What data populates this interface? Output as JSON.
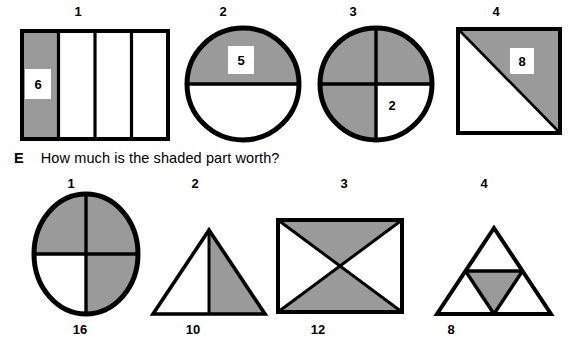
{
  "worksheet": {
    "question": {
      "tag": "E",
      "text": "How much is the shaded part worth?"
    },
    "colors": {
      "shade": "#9a9a9a",
      "stroke": "#000000",
      "background": "#ffffff"
    },
    "top_row": {
      "items": [
        {
          "number": "1",
          "shape": "rectangle-four-vertical-strips",
          "shaded_parts": 1,
          "total_parts": 4,
          "value_label": "6"
        },
        {
          "number": "2",
          "shape": "circle-halves",
          "shaded_parts": 1,
          "total_parts": 2,
          "value_label": "5"
        },
        {
          "number": "3",
          "shape": "circle-quarters",
          "shaded_parts": 3,
          "total_parts": 4,
          "value_label": "2"
        },
        {
          "number": "4",
          "shape": "square-diagonal-halves",
          "shaded_parts": 1,
          "total_parts": 2,
          "value_label": "8"
        }
      ]
    },
    "bottom_row": {
      "items": [
        {
          "number": "1",
          "shape": "circle-quarters",
          "shaded_parts": 3,
          "total_parts": 4,
          "value_label": "16"
        },
        {
          "number": "2",
          "shape": "triangle-vertical-halves",
          "shaded_parts": 1,
          "total_parts": 2,
          "value_label": "10"
        },
        {
          "number": "3",
          "shape": "rectangle-both-diagonals-bowtie",
          "shaded_parts": 2,
          "total_parts": 4,
          "value_label": "12"
        },
        {
          "number": "4",
          "shape": "triangle-midpoint-four-parts",
          "shaded_parts": 1,
          "total_parts": 4,
          "value_label": "8"
        }
      ]
    }
  }
}
